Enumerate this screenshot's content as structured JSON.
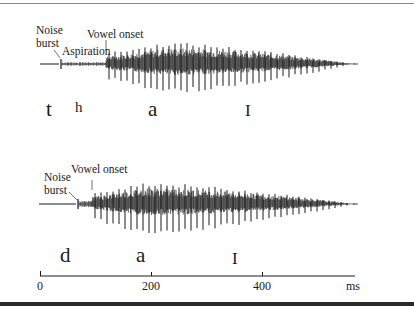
{
  "figure": {
    "top_waveform": {
      "annotations": {
        "noise_line1": "Noise",
        "noise_line2": "burst",
        "aspiration": "Aspiration",
        "vowel_onset": "Vowel onset"
      },
      "segments": {
        "t": "t",
        "h": "h",
        "a": "a",
        "i": "I"
      }
    },
    "bottom_waveform": {
      "annotations": {
        "noise_line1": "Noise",
        "noise_line2": "burst",
        "vowel_onset": "Vowel onset"
      },
      "segments": {
        "d": "d",
        "a": "a",
        "i": "I"
      }
    },
    "time_axis": {
      "ticks": [
        "0",
        "200",
        "400"
      ],
      "unit": "ms"
    },
    "colors": {
      "ink": "#1a1a1a",
      "frame_top": "#8a8a8a",
      "frame_bottom": "#2a2a2a"
    }
  }
}
